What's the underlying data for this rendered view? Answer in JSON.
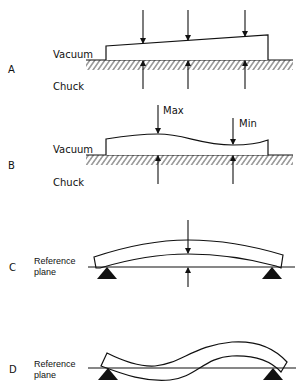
{
  "figure": {
    "panels": [
      {
        "id": "A",
        "letter": "A",
        "labels": {
          "top": "Vacuum",
          "bottom": "Chuck"
        },
        "caption": "Tapered wafer held on vacuum chuck; thickness measured at three points"
      },
      {
        "id": "B",
        "letter": "B",
        "labels": {
          "top": "Vacuum",
          "bottom": "Chuck",
          "max": "Max",
          "min": "Min"
        },
        "caption": "Wavy wafer on vacuum chuck showing max and min thickness points"
      },
      {
        "id": "C",
        "letter": "C",
        "labels": {
          "reference_line1": "Reference",
          "reference_line2": "plane"
        },
        "caption": "Bowed wafer on three-point support relative to reference plane"
      },
      {
        "id": "D",
        "letter": "D",
        "labels": {
          "reference_line1": "Reference",
          "reference_line2": "plane"
        },
        "caption": "Warped (S-shaped) wafer on supports relative to reference plane"
      }
    ]
  },
  "colors": {
    "ink": "#111111",
    "background": "#ffffff"
  }
}
